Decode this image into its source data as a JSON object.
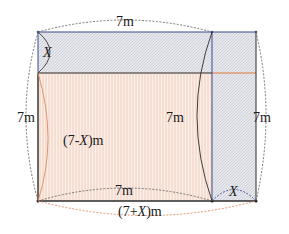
{
  "diagram": {
    "labels": {
      "top_length": "7m",
      "top_strip_height": "X",
      "left_height": "7m",
      "inner_height": "7m",
      "right_height": "7m",
      "inner_region": "(7-X)m",
      "bottom_inner_length": "7m",
      "bottom_total_length": "(7+X)m",
      "bottom_right_width": "X"
    },
    "regions": [
      {
        "name": "top-strip",
        "description": "strip of height X across 7m width",
        "fill": "gray-hatched"
      },
      {
        "name": "main-rectangle",
        "description": "(7-X) by 7 region",
        "fill": "orange-vertical-lines"
      },
      {
        "name": "right-strip",
        "description": "strip of width X, height 7m",
        "fill": "gray-hatched"
      }
    ],
    "colors": {
      "outline": "#2b2b2b",
      "blue_line": "#3a4a8a",
      "orange_line": "#e0793a",
      "hatch_gray": "#c9ccd6",
      "stripe_orange": "#f2c7b5",
      "dashed_gray": "#6a6a6a",
      "dashed_orange": "#e08a60"
    }
  }
}
